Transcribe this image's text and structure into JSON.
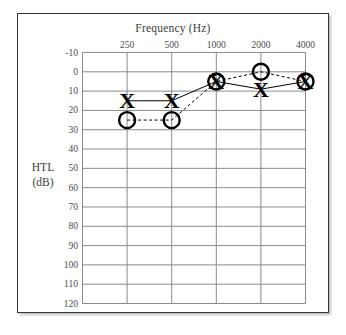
{
  "chart_data": {
    "type": "line",
    "title": "",
    "xlabel": "Frequency (Hz)",
    "ylabel_line1": "HTL",
    "ylabel_line2": "(dB)",
    "x": [
      250,
      500,
      1000,
      2000,
      4000
    ],
    "categories": [
      "250",
      "500",
      "1000",
      "2000",
      "4000"
    ],
    "xticklabels": [
      "250",
      "500",
      "1000",
      "2000",
      "4000"
    ],
    "yticklabels": [
      "-10",
      "0",
      "10",
      "20",
      "30",
      "40",
      "50",
      "60",
      "70",
      "80",
      "90",
      "100",
      "110",
      "120"
    ],
    "yvalues": [
      -10,
      0,
      10,
      20,
      30,
      40,
      50,
      60,
      70,
      80,
      90,
      100,
      110,
      120
    ],
    "ylim": [
      -10,
      120
    ],
    "y_inverted": true,
    "grid": true,
    "legend": "none",
    "series": [
      {
        "name": "left-ear-air-conduction",
        "marker": "X",
        "linestyle": "solid",
        "color": "#000000",
        "values": [
          15,
          15,
          5,
          9,
          5
        ]
      },
      {
        "name": "right-ear-air-conduction",
        "marker": "O",
        "linestyle": "dashed",
        "color": "#000000",
        "values": [
          25,
          25,
          5,
          0,
          5
        ]
      }
    ]
  },
  "axes": {
    "x_title": "Frequency (Hz)",
    "y_title_top": "HTL",
    "y_title_bottom": "(dB)"
  },
  "colors": {
    "frame": "#33343a",
    "grid": "#8a8b90",
    "marker": "#000000",
    "text": "#3b3c40",
    "background": "#ffffff"
  }
}
